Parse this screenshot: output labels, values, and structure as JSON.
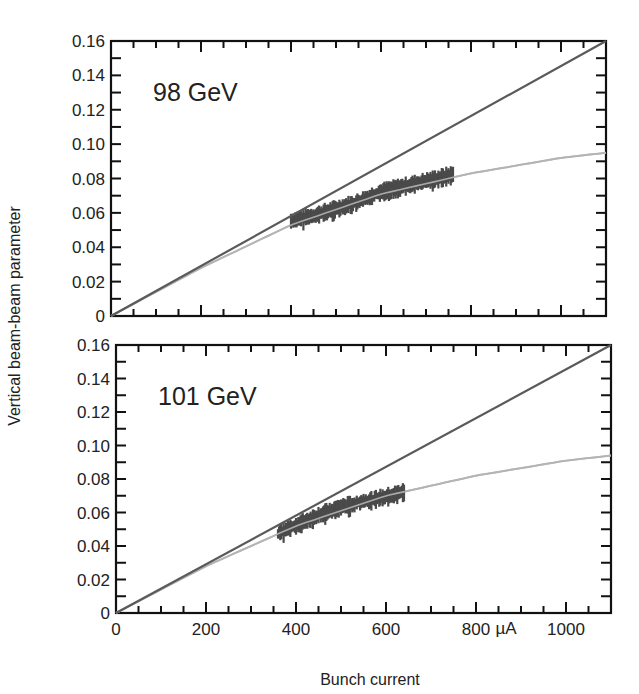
{
  "chart_data": {
    "type": "line",
    "xlabel": "Bunch current",
    "x_unit": "µA",
    "ylabel": "Vertical beam-beam parameter",
    "xlim": [
      0,
      1100
    ],
    "ylim": [
      0,
      0.16
    ],
    "x_ticks": [
      0,
      200,
      400,
      600,
      800,
      1000
    ],
    "y_ticks": [
      "0",
      "0.02",
      "0.04",
      "0.06",
      "0.08",
      "0.10",
      "0.12",
      "0.14",
      "0.16"
    ],
    "colors": {
      "linear": "#5a5a5a",
      "fit": "#b4b4b4",
      "data": "#4a4a4a",
      "axis": "#111111"
    },
    "panels": [
      {
        "label": "98 GeV",
        "linear_line": {
          "x": [
            0,
            1100
          ],
          "y": [
            0,
            0.16
          ]
        },
        "fit_curve": {
          "x": [
            0,
            200,
            400,
            600,
            800,
            1000,
            1100
          ],
          "y": [
            0,
            0.028,
            0.053,
            0.071,
            0.083,
            0.092,
            0.095
          ]
        },
        "data_band": {
          "x": [
            400,
            450,
            500,
            550,
            600,
            650,
            700,
            760
          ],
          "y": [
            0.055,
            0.058,
            0.062,
            0.066,
            0.072,
            0.075,
            0.078,
            0.082
          ]
        }
      },
      {
        "label": "101 GeV",
        "linear_line": {
          "x": [
            0,
            1100
          ],
          "y": [
            0,
            0.16
          ]
        },
        "fit_curve": {
          "x": [
            0,
            200,
            400,
            600,
            800,
            1000,
            1100
          ],
          "y": [
            0,
            0.028,
            0.052,
            0.07,
            0.082,
            0.091,
            0.094
          ]
        },
        "data_band": {
          "x": [
            360,
            400,
            450,
            500,
            550,
            600,
            640
          ],
          "y": [
            0.047,
            0.052,
            0.058,
            0.063,
            0.066,
            0.069,
            0.072
          ]
        }
      }
    ]
  }
}
